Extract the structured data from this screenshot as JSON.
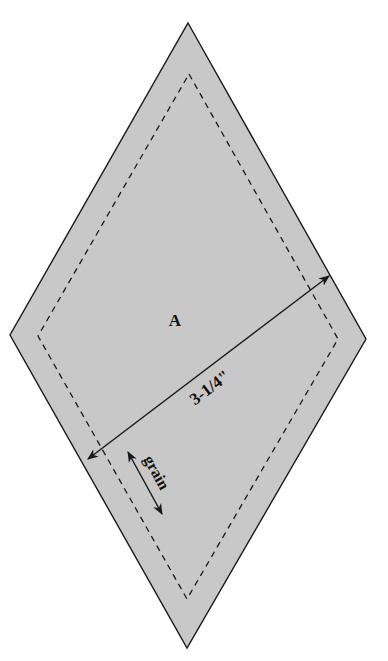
{
  "pattern": {
    "piece_label": "A",
    "dimension_label": "3-1/4\"",
    "grain_label": "grain",
    "colors": {
      "fill": "#c8c8c8",
      "outline": "#1a1a1a",
      "seam": "#1a1a1a",
      "background": "#ffffff"
    },
    "shape": "diamond",
    "outer_vertices": {
      "top": [
        188,
        23
      ],
      "right": [
        366,
        339
      ],
      "bottom": [
        187,
        648
      ],
      "left": [
        10,
        335
      ]
    },
    "seam_vertices": {
      "top": [
        189,
        74
      ],
      "right": [
        338,
        339
      ],
      "bottom": [
        187,
        599
      ],
      "left": [
        38,
        336
      ]
    },
    "seam_line_style": "dashed",
    "icons": [
      "dimension-arrow-icon",
      "grain-arrow-icon"
    ]
  }
}
